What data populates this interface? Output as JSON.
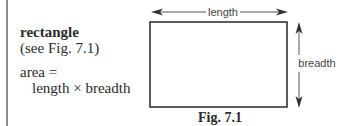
{
  "text": {
    "title": "rectangle",
    "reference": "(see Fig. 7.1)",
    "formula_lhs": "area =",
    "formula_rhs": "length × breadth"
  },
  "figure": {
    "caption": "Fig. 7.1",
    "labels": {
      "top": "length",
      "right": "breadth"
    },
    "shape": "rectangle"
  }
}
